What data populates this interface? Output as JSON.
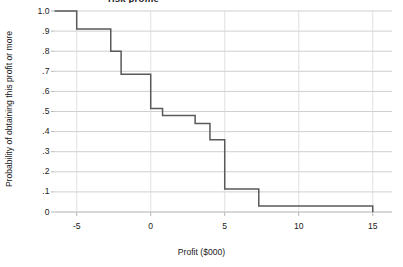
{
  "chart_data": {
    "type": "line",
    "subtype": "step-survival-curve",
    "title_visible_fragment": "risk profile",
    "title_note": "Chart title is cropped off the top edge of the screenshot; only the descenders of a bold word are visible.",
    "xlabel": "Profit ($000)",
    "ylabel": "Probability of obtaining this profit or more",
    "xlim": [
      -6.5,
      16.3
    ],
    "ylim": [
      0,
      1.0
    ],
    "xticks": [
      -5,
      0,
      5,
      10,
      15
    ],
    "xticklabels": [
      "-5",
      "0",
      "5",
      "10",
      "15"
    ],
    "yticks": [
      0,
      0.1,
      0.2,
      0.3,
      0.4,
      0.5,
      0.6,
      0.7,
      0.8,
      0.9,
      1.0
    ],
    "yticklabels": [
      "0",
      ".1",
      ".2",
      ".3",
      ".4",
      ".5",
      ".6",
      ".7",
      ".8",
      ".9",
      "1.0"
    ],
    "grid": "horizontal",
    "legend": "none",
    "line_color": "#58595b",
    "grid_color": "#c9c9c9",
    "axis_color": "#b0b0b0",
    "steps": [
      {
        "x": -6.5,
        "y": 1.0
      },
      {
        "x": -5.0,
        "y": 1.0
      },
      {
        "x": -5.0,
        "y": 0.91
      },
      {
        "x": -2.7,
        "y": 0.91
      },
      {
        "x": -2.7,
        "y": 0.8
      },
      {
        "x": -2.0,
        "y": 0.8
      },
      {
        "x": -2.0,
        "y": 0.685
      },
      {
        "x": 0.0,
        "y": 0.685
      },
      {
        "x": 0.0,
        "y": 0.515
      },
      {
        "x": 0.8,
        "y": 0.515
      },
      {
        "x": 0.8,
        "y": 0.48
      },
      {
        "x": 3.0,
        "y": 0.48
      },
      {
        "x": 3.0,
        "y": 0.44
      },
      {
        "x": 4.0,
        "y": 0.44
      },
      {
        "x": 4.0,
        "y": 0.36
      },
      {
        "x": 5.0,
        "y": 0.36
      },
      {
        "x": 5.0,
        "y": 0.115
      },
      {
        "x": 7.3,
        "y": 0.115
      },
      {
        "x": 7.3,
        "y": 0.03
      },
      {
        "x": 15.0,
        "y": 0.03
      },
      {
        "x": 15.0,
        "y": 0.0
      }
    ],
    "step_summary": [
      {
        "profit": -6.5,
        "probability": 1.0
      },
      {
        "profit": -5.0,
        "probability": 0.91
      },
      {
        "profit": -2.7,
        "probability": 0.8
      },
      {
        "profit": -2.0,
        "probability": 0.685
      },
      {
        "profit": 0.0,
        "probability": 0.515
      },
      {
        "profit": 0.8,
        "probability": 0.48
      },
      {
        "profit": 3.0,
        "probability": 0.44
      },
      {
        "profit": 4.0,
        "probability": 0.36
      },
      {
        "profit": 5.0,
        "probability": 0.115
      },
      {
        "profit": 7.3,
        "probability": 0.03
      },
      {
        "profit": 15.0,
        "probability": 0.0
      }
    ]
  }
}
